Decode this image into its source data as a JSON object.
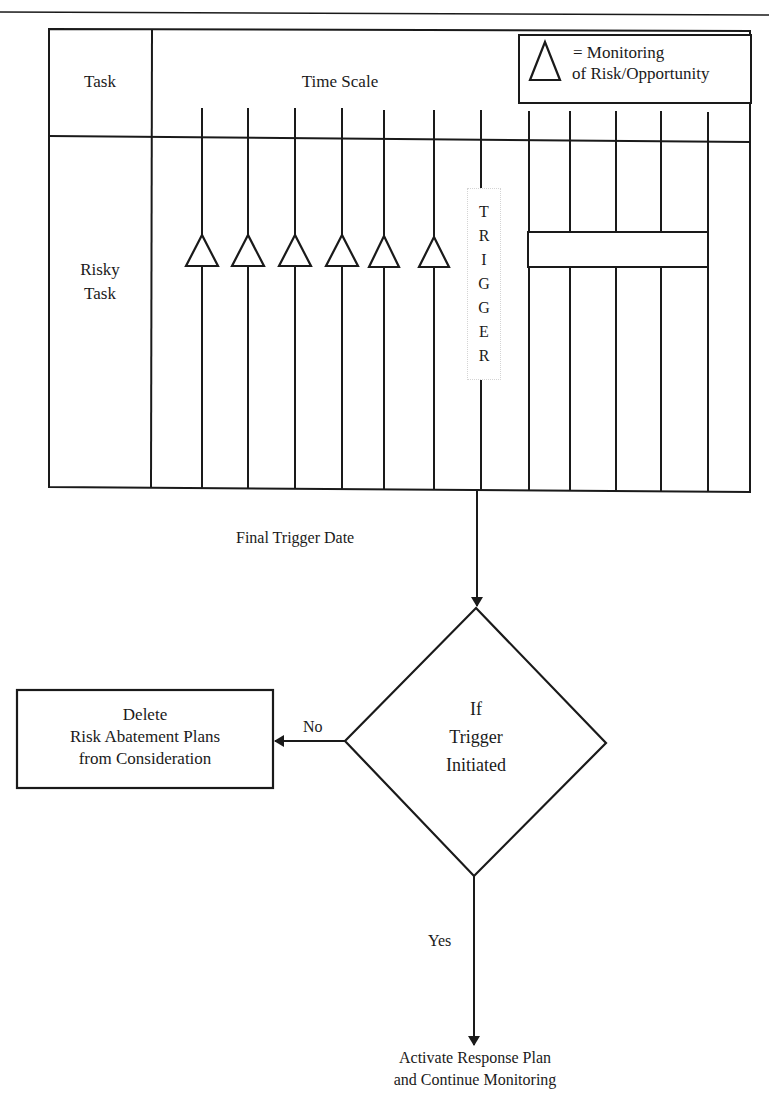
{
  "page": {
    "header_rule": true
  },
  "diagram": {
    "title": "",
    "grid": {
      "header_task": "Task",
      "header_time_scale": "Time Scale",
      "row_label_line1": "Risky",
      "row_label_line2": "Task",
      "time_lines_x": [
        202,
        248,
        295,
        342,
        384,
        434,
        481,
        529,
        570,
        616,
        661,
        708
      ],
      "monitoring_points_x": [
        202,
        248,
        295,
        342,
        384,
        434
      ],
      "trigger_letters": [
        "T",
        "R",
        "I",
        "G",
        "G",
        "E",
        "R"
      ],
      "response_bar": {
        "label": "",
        "from_x": 528,
        "to_x": 708
      }
    },
    "legend": {
      "symbol": "triangle-icon",
      "line1": "= Monitoring",
      "line2": "of Risk/Opportunity"
    },
    "final_trigger_label": "Final Trigger Date",
    "decision": {
      "line1": "If",
      "line2": "Trigger",
      "line3": "Initiated"
    },
    "no_branch": {
      "label": "No",
      "box_line1": "Delete",
      "box_line2": "Risk Abatement Plans",
      "box_line3": "from Consideration"
    },
    "yes_branch": {
      "label": "Yes",
      "result_line1": "Activate Response Plan",
      "result_line2": "and Continue Monitoring"
    },
    "colors": {
      "stroke": "#1a1a1a",
      "background": "#ffffff"
    }
  }
}
